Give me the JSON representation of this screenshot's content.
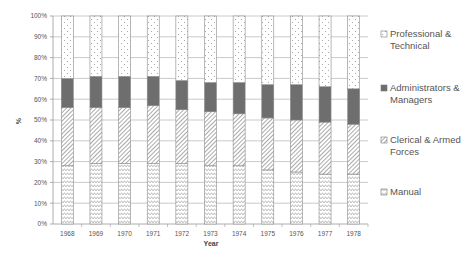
{
  "chart_data": {
    "type": "bar",
    "stacked": true,
    "percent": true,
    "title": "",
    "xlabel": "Year",
    "ylabel": "%",
    "ylim": [
      0,
      100
    ],
    "y_ticks": [
      "0%",
      "10%",
      "20%",
      "30%",
      "40%",
      "50%",
      "60%",
      "70%",
      "80%",
      "90%",
      "100%"
    ],
    "grid": true,
    "legend_position": "right",
    "categories": [
      "1968",
      "1969",
      "1970",
      "1971",
      "1972",
      "1973",
      "1974",
      "1975",
      "1976",
      "1977",
      "1978"
    ],
    "series": [
      {
        "name": "Manual",
        "pattern": "zigzag",
        "values": [
          28,
          29,
          29,
          29,
          29,
          28,
          28,
          26,
          25,
          24,
          24
        ]
      },
      {
        "name": "Clerical & Armed Forces",
        "pattern": "diagonal-hatch",
        "values": [
          28,
          27,
          27,
          28,
          26,
          26,
          25,
          25,
          25,
          25,
          24
        ]
      },
      {
        "name": "Administrators & Managers",
        "pattern": "solid-dark",
        "color": "#6e6e6e",
        "values": [
          14,
          15,
          15,
          14,
          14,
          14,
          15,
          16,
          17,
          17,
          17
        ]
      },
      {
        "name": "Professional & Technical",
        "pattern": "dots",
        "values": [
          30,
          29,
          29,
          29,
          31,
          32,
          32,
          33,
          33,
          34,
          35
        ]
      }
    ]
  },
  "legend": [
    {
      "lines": [
        "Professional &",
        "Technical"
      ],
      "pattern": "dots"
    },
    {
      "lines": [
        "Administrators &",
        "Managers"
      ],
      "pattern": "solid-dark"
    },
    {
      "lines": [
        "Clerical & Armed",
        "Forces"
      ],
      "pattern": "diagonal-hatch"
    },
    {
      "lines": [
        "Manual"
      ],
      "pattern": "zigzag"
    }
  ],
  "colors": {
    "grid": "#bdbdbd",
    "axis": "#9a9a9a",
    "bar_border": "#8a8a8a",
    "dark_fill": "#6e6e6e"
  }
}
